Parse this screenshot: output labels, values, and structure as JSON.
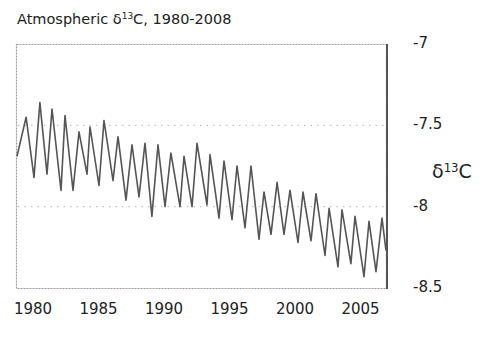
{
  "chart_data": {
    "type": "line",
    "title": "Atmospheric δ13C, 1980-2008",
    "title_parts": {
      "prefix": "Atmospheric δ",
      "sup": "13",
      "suffix": "C, 1980-2008"
    },
    "xlabel": "",
    "ylabel": "δ13C",
    "ylabel_parts": {
      "prefix": "δ",
      "sup": "13",
      "suffix": "C"
    },
    "xlim": [
      1978.7,
      2007.5
    ],
    "ylim": [
      -8.5,
      -7
    ],
    "y_axis_position": "right",
    "x_ticks": [
      "1980",
      "1985",
      "1990",
      "1995",
      "2000",
      "2005"
    ],
    "y_ticks": [
      "-7",
      "-7.5",
      "-8",
      "-8.5"
    ],
    "grid": {
      "horizontal": [
        -7.5,
        -8.0
      ],
      "style": "dotted"
    },
    "legend": null,
    "series": [
      {
        "name": "Atmospheric δ13C (seasonal cycle)",
        "color": "#555555",
        "x": [
          1978.78,
          1979.47,
          1980.08,
          1980.53,
          1981.07,
          1981.45,
          1982.14,
          1982.44,
          1983.05,
          1983.51,
          1984.12,
          1984.35,
          1985.04,
          1985.42,
          1986.11,
          1986.49,
          1987.1,
          1987.56,
          1988.09,
          1988.55,
          1989.08,
          1989.54,
          1990.08,
          1990.53,
          1991.22,
          1991.53,
          1992.14,
          1992.52,
          1993.28,
          1993.51,
          1994.2,
          1994.58,
          1995.19,
          1995.57,
          1996.18,
          1996.64,
          1997.25,
          1997.63,
          1998.17,
          1998.63,
          1999.16,
          1999.62,
          2000.23,
          2000.61,
          2001.22,
          2001.6,
          2002.29,
          2002.6,
          2003.28,
          2003.59,
          2004.27,
          2004.58,
          2005.27,
          2005.65,
          2006.18,
          2006.64,
          2006.95
        ],
        "values": [
          -7.69,
          -7.45,
          -7.82,
          -7.36,
          -7.8,
          -7.4,
          -7.9,
          -7.44,
          -7.9,
          -7.54,
          -7.8,
          -7.51,
          -7.87,
          -7.47,
          -7.84,
          -7.57,
          -7.96,
          -7.62,
          -7.94,
          -7.61,
          -8.06,
          -7.62,
          -8.0,
          -7.67,
          -8.0,
          -7.69,
          -8.0,
          -7.61,
          -7.99,
          -7.68,
          -8.07,
          -7.72,
          -8.08,
          -7.75,
          -8.13,
          -7.75,
          -8.2,
          -7.91,
          -8.17,
          -7.85,
          -8.17,
          -7.9,
          -8.22,
          -7.91,
          -8.21,
          -7.92,
          -8.3,
          -8.01,
          -8.37,
          -8.02,
          -8.35,
          -8.06,
          -8.43,
          -8.09,
          -8.4,
          -8.07,
          -8.27
        ]
      }
    ]
  }
}
